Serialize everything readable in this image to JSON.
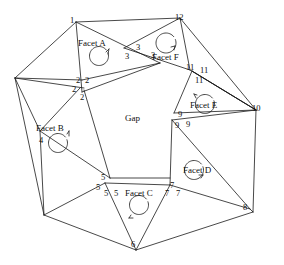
{
  "figure": {
    "background_color": "#ffffff",
    "line_color": "#1a1a1a",
    "text_color": "#101010",
    "width": 284,
    "height": 265
  },
  "center_label": {
    "text": "Gap",
    "x": 125,
    "y": 114
  },
  "facets": [
    {
      "id": "facet-a",
      "label": "Facet A",
      "x": 78,
      "y": 39,
      "arrow_cx": 99,
      "arrow_cy": 56,
      "arrow_r": 9.5,
      "arrow_dir": "ccw"
    },
    {
      "id": "facet-b",
      "label": "Facet B",
      "x": 36,
      "y": 124,
      "arrow_cx": 58,
      "arrow_cy": 143,
      "arrow_r": 9.5,
      "arrow_dir": "ccw"
    },
    {
      "id": "facet-c",
      "label": "Facet C",
      "x": 125,
      "y": 189,
      "arrow_cx": 139,
      "arrow_cy": 205,
      "arrow_r": 9.5,
      "arrow_dir": "cw"
    },
    {
      "id": "facet-d",
      "label": "Facet D",
      "x": 183,
      "y": 166,
      "arrow_cx": 194,
      "arrow_cy": 170,
      "arrow_r": 9.5,
      "arrow_dir": "ccw"
    },
    {
      "id": "facet-e",
      "label": "Facet E",
      "x": 190,
      "y": 101,
      "arrow_cx": 205,
      "arrow_cy": 104,
      "arrow_r": 9.5,
      "arrow_dir": "ccw"
    },
    {
      "id": "facet-f",
      "label": "Facet F",
      "x": 152,
      "y": 53,
      "arrow_cx": 166,
      "arrow_cy": 43,
      "arrow_r": 10,
      "arrow_dir": "ccw"
    }
  ],
  "vertex_labels": [
    {
      "text": "1",
      "x": 70,
      "y": 16
    },
    {
      "text": "12",
      "x": 175,
      "y": 13
    },
    {
      "text": "3",
      "x": 136,
      "y": 43
    },
    {
      "text": "3",
      "x": 125,
      "y": 52
    },
    {
      "text": "3",
      "x": 151,
      "y": 51
    },
    {
      "text": "11",
      "x": 186,
      "y": 63
    },
    {
      "text": "11",
      "x": 200,
      "y": 66
    },
    {
      "text": "11",
      "x": 195,
      "y": 76
    },
    {
      "text": "10",
      "x": 252,
      "y": 104
    },
    {
      "text": "2",
      "x": 76,
      "y": 76
    },
    {
      "text": "2",
      "x": 85,
      "y": 76
    },
    {
      "text": "2",
      "x": 72,
      "y": 85
    },
    {
      "text": "2",
      "x": 80,
      "y": 93
    },
    {
      "text": "9",
      "x": 178,
      "y": 110
    },
    {
      "text": "9",
      "x": 175,
      "y": 121
    },
    {
      "text": "9",
      "x": 186,
      "y": 120
    },
    {
      "text": "4",
      "x": 39,
      "y": 136
    },
    {
      "text": "5",
      "x": 101,
      "y": 173
    },
    {
      "text": "5",
      "x": 96,
      "y": 183
    },
    {
      "text": "5",
      "x": 104,
      "y": 189
    },
    {
      "text": "5",
      "x": 114,
      "y": 189
    },
    {
      "text": "7",
      "x": 170,
      "y": 181
    },
    {
      "text": "7",
      "x": 165,
      "y": 189
    },
    {
      "text": "7",
      "x": 176,
      "y": 189
    },
    {
      "text": "8",
      "x": 243,
      "y": 203
    },
    {
      "text": "6",
      "x": 131,
      "y": 240
    }
  ],
  "edges": [
    {
      "id": "outer-1-to-topright",
      "path": "M 76,22 L 180,18"
    },
    {
      "id": "outer-left-upper",
      "path": "M 76,22 L 15,78"
    },
    {
      "id": "outer-left-lower",
      "path": "M 15,78 L 44,215"
    },
    {
      "id": "outer-bottom-left",
      "path": "M 44,215 L 136,250"
    },
    {
      "id": "outer-bottom-right",
      "path": "M 136,250 L 253,212"
    },
    {
      "id": "outer-right",
      "path": "M 253,212 L 256,110"
    },
    {
      "id": "outer-topright",
      "path": "M 256,110 L 180,18"
    },
    {
      "id": "facet-a-left",
      "path": "M 76,22 L 82,92"
    },
    {
      "id": "facet-a-right",
      "path": "M 76,22 L 160,63"
    },
    {
      "id": "facet-a-base",
      "path": "M 82,92 L 160,63"
    },
    {
      "id": "cross-1",
      "path": "M 82,80 L 160,63"
    },
    {
      "id": "facet-f-left",
      "path": "M 180,18 L 124,48"
    },
    {
      "id": "facet-f-right",
      "path": "M 180,18 L 190,70"
    },
    {
      "id": "facet-f-base",
      "path": "M 124,48 L 190,70"
    },
    {
      "id": "corner-top-left-fan",
      "path": "M 15,78 L 82,80"
    },
    {
      "id": "corner-top-left-fan2",
      "path": "M 15,78 L 84,88"
    },
    {
      "id": "facet-b-top",
      "path": "M 80,88 L 40,131"
    },
    {
      "id": "facet-b-right",
      "path": "M 84,90 L 110,178"
    },
    {
      "id": "facet-b-base",
      "path": "M 40,131 L 110,178"
    },
    {
      "id": "left-lower-to-4",
      "path": "M 15,78 L 40,131"
    },
    {
      "id": "four-down",
      "path": "M 40,131 L 44,215"
    },
    {
      "id": "facet-c-left",
      "path": "M 105,183 L 136,250"
    },
    {
      "id": "facet-c-right",
      "path": "M 136,250 L 170,185"
    },
    {
      "id": "facet-c-top",
      "path": "M 105,183 L 170,185"
    },
    {
      "id": "bottom-left-to-c",
      "path": "M 44,215 L 105,183"
    },
    {
      "id": "gap-bottom",
      "path": "M 110,178 L 170,178"
    },
    {
      "id": "facet-d-left",
      "path": "M 172,120 L 170,185"
    },
    {
      "id": "facet-d-diag",
      "path": "M 172,120 L 250,209"
    },
    {
      "id": "facet-d-base",
      "path": "M 170,185 L 250,209"
    },
    {
      "id": "right-col-top",
      "path": "M 172,120 L 256,110"
    },
    {
      "id": "facet-e-left",
      "path": "M 174,113 L 192,71"
    },
    {
      "id": "facet-e-right",
      "path": "M 192,71 L 256,110"
    },
    {
      "id": "facet-e-base",
      "path": "M 174,113 L 256,110"
    },
    {
      "id": "e-to-outer",
      "path": "M 192,71 L 256,110"
    },
    {
      "id": "f-to-outer",
      "path": "M 190,70 L 256,110"
    },
    {
      "id": "bottom-right-corner",
      "path": "M 253,212 L 250,209"
    }
  ],
  "arrow_heads": [
    {
      "id": "arrow-a",
      "path": "M 106,52 L 109,49 M 109,49 L 108,54"
    },
    {
      "id": "arrow-b",
      "path": "M 67,134 L 69,131 M 69,131 L 69,136"
    },
    {
      "id": "arrow-c",
      "path": "M 131,215 L 129,218 M 129,218 L 133,218"
    },
    {
      "id": "arrow-d",
      "path": "M 201,178 L 203,175 M 203,175 L 199,175"
    },
    {
      "id": "arrow-e",
      "path": "M 197,95 L 194,94 M 194,94 L 196,98"
    },
    {
      "id": "arrow-f",
      "path": "M 174,50 L 175,46 M 175,46 L 171,47"
    }
  ]
}
